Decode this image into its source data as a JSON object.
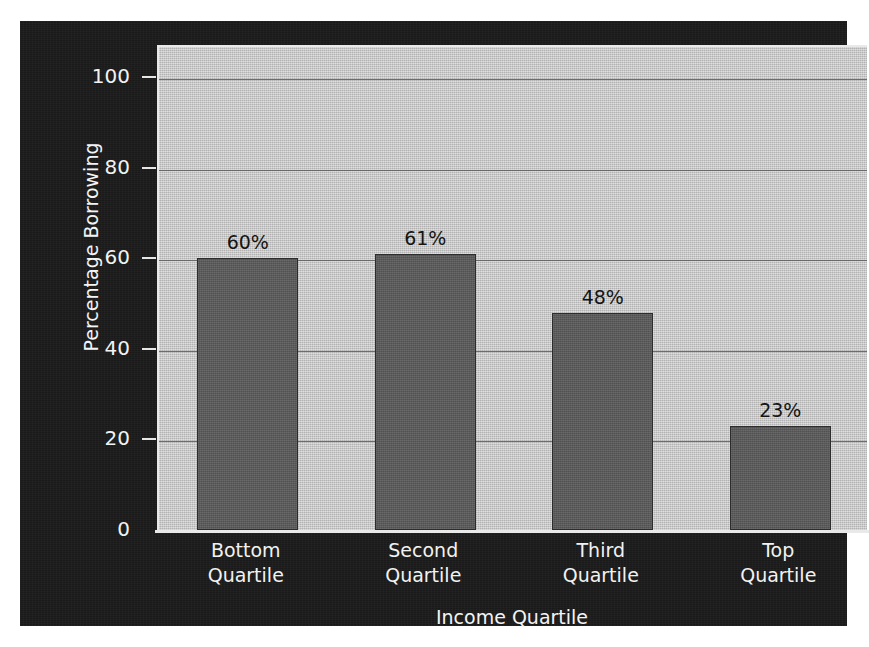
{
  "chart_data": {
    "type": "bar",
    "title": "",
    "categories": [
      "Bottom Quartile",
      "Second Quartile",
      "Third Quartile",
      "Top Quartile"
    ],
    "category_lines": [
      [
        "Bottom",
        "Quartile"
      ],
      [
        "Second",
        "Quartile"
      ],
      [
        "Third",
        "Quartile"
      ],
      [
        "Top",
        "Quartile"
      ]
    ],
    "values": [
      60,
      61,
      48,
      23
    ],
    "value_labels": [
      "60%",
      "61%",
      "48%",
      "23%"
    ],
    "xlabel": "Income Quartile",
    "ylabel": "Percentage Borrowing",
    "ylim": [
      0,
      100
    ],
    "yticks": [
      0,
      20,
      40,
      60,
      80,
      100
    ],
    "ytick_labels": [
      "0",
      "20",
      "40",
      "60",
      "80",
      "100"
    ],
    "grid": "horizontal",
    "legend": "none",
    "colors": {
      "panel_background": "#1b1b1b",
      "plot_background": "#c4c4c4",
      "bar_fill": "#5b5b5b",
      "bar_border": "#2c2c2c",
      "gridline": "#5a5a5a",
      "axis_text": "#f2f2f2",
      "value_label_text": "#141414"
    }
  }
}
